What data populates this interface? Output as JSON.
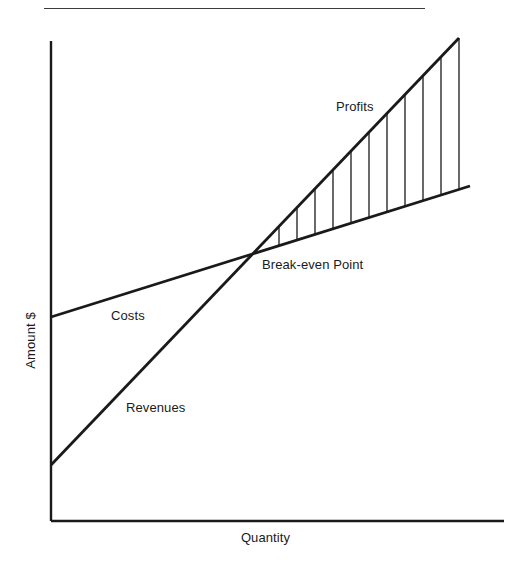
{
  "figure": {
    "title": "",
    "has_top_rule": true,
    "background_color": "#ffffff",
    "line_color": "#1a1a1a",
    "text_color": "#1a1a1a"
  },
  "labels": {
    "profits": "Profits",
    "breakeven": "Break-even Point",
    "costs": "Costs",
    "revenues": "Revenues",
    "x_axis": "Quantity",
    "y_axis": "Amount $"
  },
  "chart_data": {
    "type": "line",
    "title": "",
    "subtitle": "",
    "xlabel": "Quantity",
    "ylabel": "Amount $",
    "xlim": [
      0,
      100
    ],
    "ylim": [
      0,
      100
    ],
    "grid": false,
    "legend": "inline-annotations",
    "axis_ticks": {
      "x": [],
      "y": []
    },
    "series": [
      {
        "name": "Costs",
        "type": "line",
        "x": [
          0,
          100
        ],
        "values": [
          42.5,
          69.8
        ],
        "label_position": {
          "x": 13,
          "y": 44
        },
        "description": "Total cost line with positive fixed-cost intercept and shallow slope"
      },
      {
        "name": "Revenues",
        "type": "line",
        "x": [
          0,
          100
        ],
        "values": [
          11.6,
          100.0
        ],
        "label_position": {
          "x": 18,
          "y": 25
        },
        "description": "Total revenue line starting above origin with steep slope"
      }
    ],
    "annotations": [
      {
        "name": "Break-even Point",
        "text": "Break-even Point",
        "x": 46.6,
        "y": 57.4,
        "description": "Intersection of the Revenues and Costs lines"
      },
      {
        "name": "Profits",
        "text": "Profits",
        "x": 70,
        "y": 88,
        "description": "Hatched wedge between Revenues and Costs to the right of break-even"
      }
    ],
    "shaded_region": {
      "name": "Profits",
      "between": [
        "Revenues",
        "Costs"
      ],
      "from_x": 46.6,
      "to_x": 100,
      "fill": "vertical-hatching",
      "hatch_line_count": 11
    }
  },
  "geometry": {
    "axes": {
      "origin": {
        "x": 51,
        "y": 521
      },
      "y_top": 41,
      "x_right": 504,
      "stroke_width": 2.4
    },
    "top_rule": {
      "x1": 44,
      "x2": 425,
      "y": 8
    },
    "costs_line": {
      "x1": 51,
      "y1": 317,
      "x2": 470,
      "y2": 186,
      "stroke_width": 2.8
    },
    "revenues_line": {
      "x1": 51,
      "y1": 465,
      "x2": 459,
      "y2": 38,
      "stroke_width": 2.8
    },
    "intersection": {
      "x": 262,
      "y": 244
    },
    "hatch_x_positions": [
      279,
      297,
      315,
      333,
      351,
      369,
      387,
      405,
      423,
      441,
      459
    ],
    "hatch_stroke_width": 1.3
  }
}
